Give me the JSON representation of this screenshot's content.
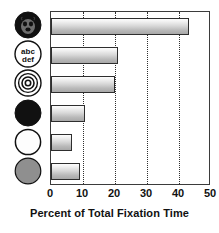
{
  "chart_data": {
    "type": "bar",
    "orientation": "horizontal",
    "title": "",
    "xlabel": "Percent of Total Fixation Time",
    "ylabel": "",
    "xlim": [
      0,
      50
    ],
    "xticks": [
      0,
      10,
      20,
      30,
      40,
      50
    ],
    "xtick_labels": [
      "0",
      "10",
      "20",
      "30",
      "40",
      "50"
    ],
    "grid": "vertical-dotted",
    "legend": "none",
    "categories": [
      "face-icon",
      "text-abc-def-icon",
      "bullseye-icon",
      "black-circle-icon",
      "white-circle-icon",
      "gray-circle-icon"
    ],
    "category_labels": [
      "",
      "",
      "",
      "",
      "",
      ""
    ],
    "values": [
      43,
      21,
      20,
      10.5,
      6.5,
      9
    ],
    "bar_fill": "#d8d8d8",
    "bar_edge": "#2e2e2e"
  },
  "icons": [
    {
      "name": "face-icon",
      "description": "dark filled circle containing a face",
      "fill": "#111111",
      "stroke": "#111111",
      "text": ""
    },
    {
      "name": "text-abc-def-icon",
      "description": "white circle containing two lines of text",
      "fill": "#ffffff",
      "stroke": "#111111",
      "text": "abc def",
      "line1": "abc",
      "line2": "def"
    },
    {
      "name": "bullseye-icon",
      "description": "concentric circles target",
      "fill": "#ffffff",
      "stroke": "#111111",
      "text": ""
    },
    {
      "name": "black-circle-icon",
      "description": "solid black filled circle",
      "fill": "#111111",
      "stroke": "#111111",
      "text": ""
    },
    {
      "name": "white-circle-icon",
      "description": "empty white circle with black outline",
      "fill": "#fdfdfd",
      "stroke": "#111111",
      "text": ""
    },
    {
      "name": "gray-circle-icon",
      "description": "solid gray filled circle",
      "fill": "#8f8f8f",
      "stroke": "#111111",
      "text": ""
    }
  ],
  "axis": {
    "title": "Percent of Total Fixation Time",
    "ticks": [
      "0",
      "10",
      "20",
      "30",
      "40",
      "50"
    ]
  },
  "colors": {
    "axis_line": "#3b3b3b",
    "gridline": "#2f2f2f",
    "text": "#111111",
    "background": "#ffffff"
  }
}
